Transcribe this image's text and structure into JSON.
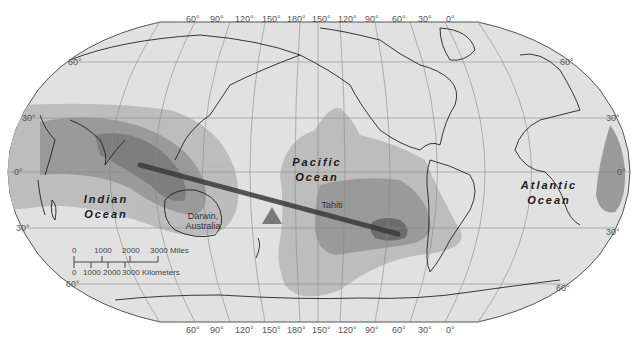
{
  "map": {
    "projection": "Robinson (Pacific-centered)",
    "colors": {
      "land_ocean_base": "#e1e1e1",
      "shade_light": "#bdbdbd",
      "shade_medium": "#9a9a9a",
      "shade_dark": "#7e7e7e",
      "shade_darkest": "#5f5f5f",
      "coastline": "#222222",
      "graticule": "#8a8a8a",
      "arrow": "#3a3a3a",
      "triangle": "#7a7a7a"
    },
    "longitude_labels_top": [
      "60°",
      "90°",
      "120°",
      "150°",
      "180°",
      "150°",
      "120°",
      "90°",
      "60°",
      "30°",
      "0°"
    ],
    "longitude_labels_bottom": [
      "60°",
      "90°",
      "120°",
      "150°",
      "180°",
      "150°",
      "120°",
      "90°",
      "60°",
      "30°",
      "0°"
    ],
    "latitude_labels_left": [
      "60°",
      "30°",
      "0°",
      "30°",
      "60°"
    ],
    "latitude_labels_right": [
      "60°",
      "30°",
      "0°",
      "30°",
      "60°"
    ],
    "ocean_labels": {
      "indian": [
        "Indian",
        "Ocean"
      ],
      "pacific": [
        "Pacific",
        "Ocean"
      ],
      "atlantic": [
        "Atlantic",
        "Ocean"
      ]
    },
    "place_labels": {
      "darwin": [
        "Darwin,",
        "Australia"
      ],
      "tahiti": "Tahiti"
    },
    "scale_bar": {
      "miles_ticks": [
        "0",
        "1000",
        "2000",
        "3000 Miles"
      ],
      "km_ticks": [
        "0",
        "1000",
        "2000",
        "3000 Kilometers"
      ]
    }
  }
}
